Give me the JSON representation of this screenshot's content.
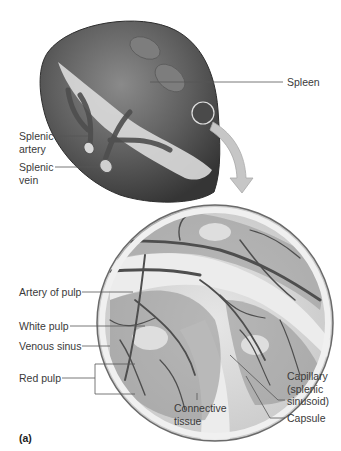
{
  "figure": {
    "panel_label": "(a)",
    "colors": {
      "spleen_dark": "#4a4a4a",
      "spleen_mid": "#6e6e6e",
      "spleen_light": "#9a9a9a",
      "hilum_light": "#d8d8d8",
      "pulp_light": "#d4d4d4",
      "vessel": "#5a5a5a",
      "connective": "#e4e4e4",
      "arrow": "#c4c4c4",
      "leader_line": "#555555",
      "text": "#3a3a3a"
    }
  },
  "labels": {
    "spleen": "Spleen",
    "splenic_artery": "Splenic\nartery",
    "splenic_vein": "Splenic\nvein",
    "artery_of_pulp": "Artery of pulp",
    "white_pulp": "White pulp",
    "venous_sinus": "Venous sinus",
    "red_pulp": "Red pulp",
    "connective_tissue": "Connective\ntissue",
    "capillary": "Capillary\n(splenic\nsinusoid)",
    "capsule": "Capsule"
  }
}
